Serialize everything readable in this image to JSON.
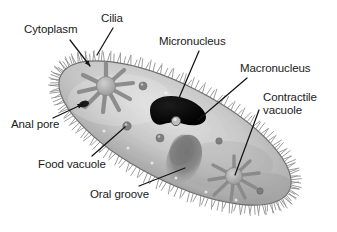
{
  "diagram": {
    "background_color": "#ffffff",
    "line_color": "#141414",
    "text_color": "#1a1a1a",
    "body_fill_light": "#d8d8d8",
    "body_fill_mid": "#b6b6b6",
    "body_fill_dark": "#8f8f8f",
    "macronucleus_color": "#090909",
    "cilia_color": "#7d7d7d"
  },
  "labels": [
    {
      "id": "cytoplasm",
      "text": "Cytoplasm",
      "lines": [
        "Cytoplasm"
      ],
      "x": 24,
      "y": 23,
      "leader": {
        "x1": 70,
        "y1": 40,
        "x2": 90,
        "y2": 66
      }
    },
    {
      "id": "cilia",
      "text": "Cilia",
      "lines": [
        "Cilia"
      ],
      "x": 101,
      "y": 12,
      "leader": {
        "x1": 113,
        "y1": 28,
        "x2": 97,
        "y2": 55
      }
    },
    {
      "id": "micronucleus",
      "text": "Micronucleus",
      "lines": [
        "Micronucleus"
      ],
      "x": 159,
      "y": 35,
      "leader": {
        "x1": 199,
        "y1": 51,
        "x2": 176,
        "y2": 105
      }
    },
    {
      "id": "macronucleus",
      "text": "Macronucleus",
      "lines": [
        "Macronucleus"
      ],
      "x": 240,
      "y": 62,
      "leader": {
        "x1": 247,
        "y1": 78,
        "x2": 198,
        "y2": 120
      }
    },
    {
      "id": "contractile-vacuole",
      "text": "Contractile vacuole",
      "lines": [
        "Contractile",
        "vacuole"
      ],
      "x": 263,
      "y": 91,
      "leader": {
        "x1": 259,
        "y1": 110,
        "x2": 235,
        "y2": 175
      }
    },
    {
      "id": "anal-pore",
      "text": "Anal pore",
      "lines": [
        "Anal pore"
      ],
      "x": 11,
      "y": 118,
      "leader": {
        "x1": 53,
        "y1": 118,
        "x2": 83,
        "y2": 104
      }
    },
    {
      "id": "food-vacuole",
      "text": "Food vacuole",
      "lines": [
        "Food vacuole"
      ],
      "x": 38,
      "y": 158,
      "leader": {
        "x1": 92,
        "y1": 156,
        "x2": 125,
        "y2": 127
      }
    },
    {
      "id": "oral-groove",
      "text": "Oral groove",
      "lines": [
        "Oral groove"
      ],
      "x": 90,
      "y": 188,
      "leader": {
        "x1": 139,
        "y1": 186,
        "x2": 185,
        "y2": 168
      }
    }
  ],
  "structures": {
    "body": {
      "name": "cell-body",
      "cx": 175,
      "cy": 133,
      "rx": 128,
      "ry": 48,
      "rotation_deg": 27
    },
    "contractile_vacuole_upper": {
      "cx": 106,
      "cy": 86,
      "r": 10,
      "canals": 9
    },
    "contractile_vacuole_lower": {
      "cx": 234,
      "cy": 176,
      "r": 9,
      "canals": 9
    },
    "macronucleus": {
      "cx": 177,
      "cy": 111,
      "rx": 29,
      "ry": 14
    },
    "micronucleus": {
      "cx": 176,
      "cy": 120,
      "r": 4
    },
    "oral_groove": {
      "cx": 184,
      "cy": 160,
      "rx": 16,
      "ry": 23
    },
    "anal_pore": {
      "cx": 84,
      "cy": 104,
      "rx": 5,
      "ry": 3
    },
    "food_vacuoles": [
      {
        "cx": 127,
        "cy": 126,
        "r": 4
      },
      {
        "cx": 143,
        "cy": 86,
        "r": 4
      },
      {
        "cx": 160,
        "cy": 138,
        "r": 4
      },
      {
        "cx": 219,
        "cy": 141,
        "r": 3
      },
      {
        "cx": 260,
        "cy": 191,
        "r": 3
      }
    ]
  }
}
